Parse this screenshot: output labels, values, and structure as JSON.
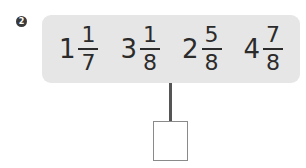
{
  "problem": {
    "number": "2",
    "numbers": [
      {
        "whole": "1",
        "numerator": "1",
        "denominator": "7"
      },
      {
        "whole": "3",
        "numerator": "1",
        "denominator": "8"
      },
      {
        "whole": "2",
        "numerator": "5",
        "denominator": "8"
      },
      {
        "whole": "4",
        "numerator": "7",
        "denominator": "8"
      }
    ],
    "answer": ""
  },
  "colors": {
    "panel_bg": "#e6e6e6",
    "text": "#2b2b2b",
    "connector": "#555555"
  }
}
